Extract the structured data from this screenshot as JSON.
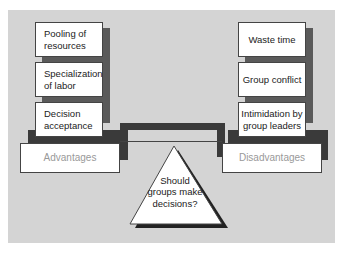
{
  "diagram": {
    "advantages_label": "Advantages",
    "disadvantages_label": "Disadvantages",
    "fulcrum_question": [
      "Should",
      "groups make",
      "decisions?"
    ],
    "advantages": [
      {
        "line1": "Pooling of",
        "line2": "resources"
      },
      {
        "line1": "Specialization",
        "line2": "of labor"
      },
      {
        "line1": "Decision",
        "line2": "acceptance"
      }
    ],
    "disadvantages": [
      {
        "line1": "Waste time",
        "line2": ""
      },
      {
        "line1": "Group conflict",
        "line2": ""
      },
      {
        "line1": "Intimidation by",
        "line2": "group leaders"
      }
    ]
  },
  "colors": {
    "panel": "#d4d4d4",
    "box": "#ffffff",
    "shadow": "#3a3a3a",
    "label_text": "#999999"
  }
}
